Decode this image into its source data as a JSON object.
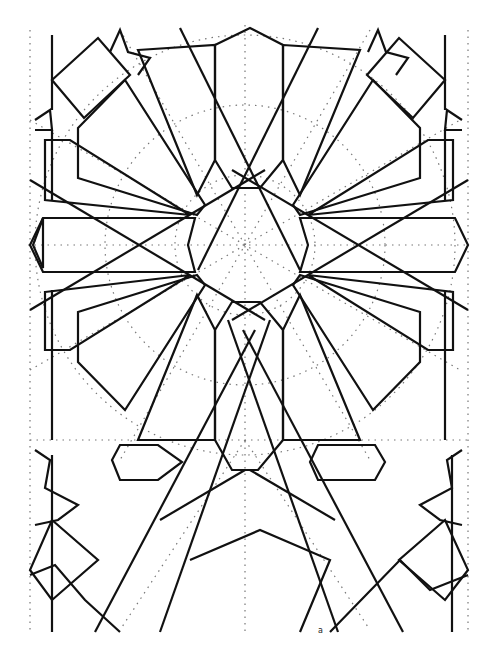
{
  "figure": {
    "corner_label": "a",
    "colors": {
      "line": "#111111",
      "construction": "#777777",
      "background": "#ffffff"
    }
  }
}
